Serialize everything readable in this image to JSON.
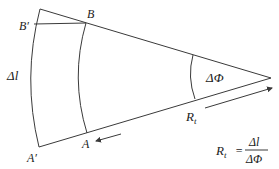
{
  "diagram": {
    "labels": {
      "b_prime": "B′",
      "b": "B",
      "delta_l": "Δl",
      "a_prime": "A′",
      "a": "A",
      "delta_phi": "ΔΦ",
      "radius": "Rt"
    },
    "formula": {
      "lhs": "Rt",
      "equals": "=",
      "numerator": "Δl",
      "denominator": "ΔΦ"
    },
    "colors": {
      "line": "#3a3a3a",
      "text": "#222222",
      "background": "#ffffff"
    }
  }
}
